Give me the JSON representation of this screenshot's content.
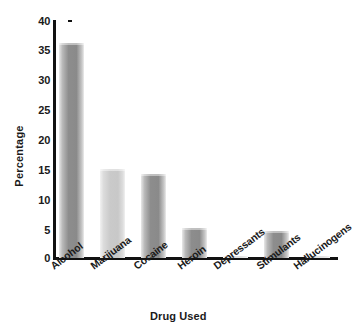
{
  "chart_data": {
    "type": "bar",
    "title": "",
    "xlabel": "Drug Used",
    "ylabel": "Percentage",
    "categories": [
      "Alcohol",
      "Marijuana",
      "Cocaine",
      "Heroin",
      "Depressants",
      "Stimulants",
      "Hallucinogens"
    ],
    "values": [
      36.2,
      15.0,
      14.1,
      5.1,
      0.3,
      4.5,
      0.3
    ],
    "ylim": [
      0,
      40
    ],
    "yticks": [
      0,
      5,
      10,
      15,
      20,
      25,
      30,
      35,
      40
    ],
    "ytick_labels": [
      "0",
      "5",
      "10",
      "15",
      "20",
      "25",
      "30",
      "35",
      "40"
    ],
    "grid": false,
    "legend": "none",
    "bar_colors": [
      "#8a8a8a",
      "#c8c8c8",
      "#8a8a8a",
      "#8a8a8a",
      "#c8c8c8",
      "#8a8a8a",
      "#c8c8c8"
    ],
    "axis_color": "#111111"
  },
  "axes": {
    "y_title": "Percentage",
    "x_title": "Drug Used"
  }
}
